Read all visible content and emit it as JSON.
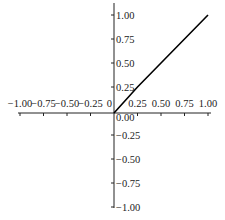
{
  "chart_data": {
    "type": "line",
    "title": "",
    "xlabel": "",
    "ylabel": "",
    "xlim": [
      -1.0,
      1.0
    ],
    "ylim": [
      -1.0,
      1.0
    ],
    "grid": false,
    "legend": null,
    "axes_style": "centered-at-origin",
    "x_ticks": [
      "-1.00",
      "-0.75",
      "-0.50",
      "-0.25",
      "0",
      "0.25",
      "0.50",
      "0.75",
      "1.00"
    ],
    "x_tick_values": [
      -1.0,
      -0.75,
      -0.5,
      -0.25,
      0,
      0.25,
      0.5,
      0.75,
      1.0
    ],
    "y_ticks": [
      "1.00",
      "0.75",
      "0.50",
      "0.25",
      "0.00",
      "-0.25",
      "-0.50",
      "-0.75",
      "-1.00"
    ],
    "y_tick_values": [
      1.0,
      0.75,
      0.5,
      0.25,
      0.0,
      -0.25,
      -0.5,
      -0.75,
      -1.0
    ],
    "series": [
      {
        "name": "y = x (x ≥ 0)",
        "color": "#000000",
        "x": [
          0.0,
          0.25,
          0.5,
          0.75,
          1.0
        ],
        "y": [
          0.0,
          0.25,
          0.5,
          0.75,
          1.0
        ]
      }
    ]
  },
  "colors": {
    "axis": "#222222",
    "line": "#000000",
    "background": "#ffffff"
  }
}
